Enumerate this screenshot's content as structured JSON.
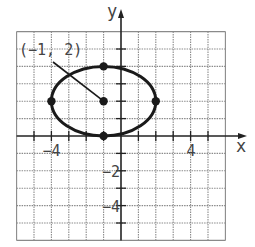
{
  "figure": {
    "type": "coordinate-plane-ellipse",
    "axes": {
      "x_label": "x",
      "y_label": "y",
      "x_range": [
        -6,
        6
      ],
      "y_range": [
        -6,
        6
      ],
      "grid": true,
      "x_tick_labels": [
        {
          "value": -4,
          "text": "−4"
        },
        {
          "value": 4,
          "text": "4"
        }
      ],
      "y_tick_labels": [
        {
          "value": -2,
          "text": "−2"
        },
        {
          "value": -4,
          "text": "−4"
        }
      ]
    },
    "ellipse": {
      "center": [
        -1,
        2
      ],
      "semi_major_x": 3,
      "semi_minor_y": 2,
      "points": [
        [
          -1,
          2
        ],
        [
          -4,
          2
        ],
        [
          2,
          2
        ],
        [
          -1,
          4
        ],
        [
          -1,
          0
        ]
      ]
    },
    "annotation": {
      "text": "(−1,  2)",
      "points_to": [
        -1,
        2
      ]
    },
    "colors": {
      "grid": "#8a8a8a",
      "axis": "#222222",
      "curve": "#1a1a1a",
      "text": "#444444"
    }
  }
}
